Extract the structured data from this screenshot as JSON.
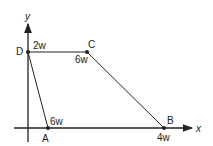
{
  "diagram": {
    "axes": {
      "x_label": "x",
      "y_label": "y"
    },
    "points": [
      {
        "name": "D",
        "load": "2w"
      },
      {
        "name": "C",
        "load": "6w"
      },
      {
        "name": "A",
        "load": "6w"
      },
      {
        "name": "B",
        "load": "4w"
      }
    ],
    "colors": {
      "line": "#222222",
      "background": "#ffffff"
    }
  }
}
